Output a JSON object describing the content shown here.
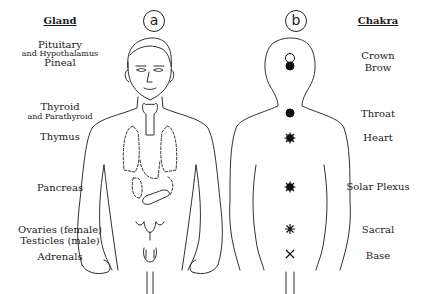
{
  "figure": {
    "panel_a": {
      "tag": "a",
      "header": "Gland",
      "glands": [
        {
          "lines": [
            "Pituitary"
          ],
          "size": "big"
        },
        {
          "lines": [
            "and Hypothalamus"
          ],
          "size": "small"
        },
        {
          "lines": [
            "Pineal"
          ],
          "size": "big"
        },
        {
          "lines": [
            "Thyroid"
          ],
          "size": "big"
        },
        {
          "lines": [
            "and Parathyroid"
          ],
          "size": "small"
        },
        {
          "lines": [
            "Thymus"
          ],
          "size": "big"
        },
        {
          "lines": [
            "Pancreas"
          ],
          "size": "big"
        },
        {
          "lines": [
            "Ovaries (female)"
          ],
          "size": "big"
        },
        {
          "lines": [
            "Testicles (male)"
          ],
          "size": "big"
        },
        {
          "lines": [
            "Adrenals"
          ],
          "size": "big"
        }
      ]
    },
    "panel_b": {
      "tag": "b",
      "header": "Chakra",
      "chakras": [
        "Crown",
        "Brow",
        "Throat",
        "Heart",
        "Solar Plexus",
        "Sacral",
        "Base"
      ],
      "markers": [
        "open-circle",
        "filled-circle",
        "filled-circle",
        "starburst",
        "starburst",
        "asterisk",
        "cross"
      ]
    },
    "colors": {
      "ink": "#1a1a1a",
      "background": "#ffffff"
    }
  }
}
